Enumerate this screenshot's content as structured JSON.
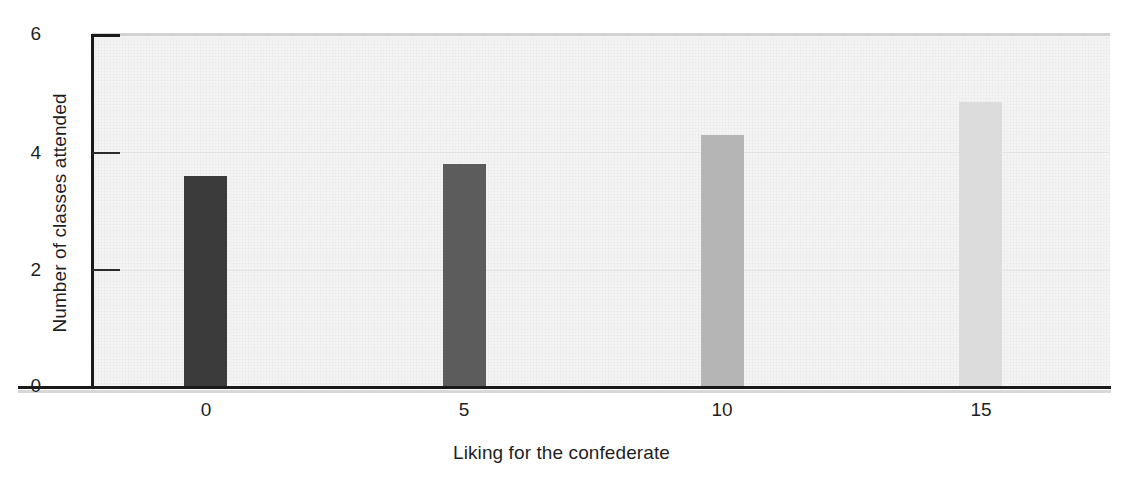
{
  "chart_data": {
    "type": "bar",
    "title": "",
    "subtitle": "",
    "xlabel": "Liking for the confederate",
    "ylabel": "Number of classes attended",
    "categories": [
      "0",
      "5",
      "10",
      "15"
    ],
    "values": [
      3.6,
      3.8,
      4.3,
      4.85
    ],
    "series": [
      {
        "name": "Number of classes attended",
        "values": [
          3.6,
          3.8,
          4.3,
          4.85
        ]
      }
    ],
    "bar_colors": [
      "#3b3b3b",
      "#5c5c5c",
      "#b5b5b5",
      "#dcdcdc"
    ],
    "xlim": [
      -2.2,
      17.5
    ],
    "ylim": [
      0,
      6
    ],
    "x_tick_labels": [
      "0",
      "5",
      "10",
      "15"
    ],
    "y_tick_labels": [
      "0",
      "2",
      "4",
      "6"
    ],
    "y_ticks": [
      0,
      2,
      4,
      6
    ],
    "grid": "horizontal-faint",
    "legend": "none",
    "legend_position": "none",
    "annotations": [],
    "plot_background_color": "#f4f4f4",
    "axis_color": "#1a1a1a",
    "gridline_color": "#e3e3e3"
  },
  "figure": {
    "y_axis_title": "Number of classes attended",
    "x_axis_title": "Liking for the confederate"
  }
}
